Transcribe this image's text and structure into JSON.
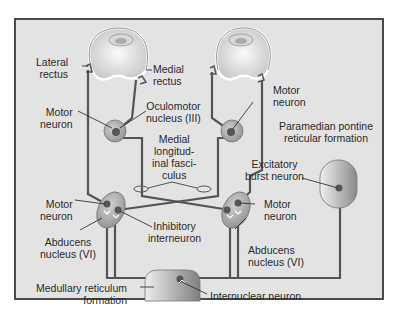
{
  "diagram": {
    "colors": {
      "background": "#e3e3e3",
      "frame_border": "#4a4a4a",
      "nerve_line": "#555555",
      "nucleus_fill": "#b8b8b8",
      "neuron_dot": "#555555",
      "text": "#2a2a2a"
    },
    "labels": {
      "lateral_rectus": [
        "Lateral",
        "rectus"
      ],
      "medial_rectus": [
        "Medial",
        "rectus"
      ],
      "motor_neuron_left_top": [
        "Motor",
        "neuron"
      ],
      "oculomotor_nucleus": [
        "Oculomotor",
        "nucleus (III)"
      ],
      "motor_neuron_right_top": [
        "Motor",
        "neuron"
      ],
      "pprf": [
        "Paramedian pontine",
        "reticular formation"
      ],
      "mlf": [
        "Medial",
        "longitud-",
        "inal fasci-",
        "culus"
      ],
      "excitatory_burst_neuron": [
        "Excitatory",
        "burst neuron"
      ],
      "motor_neuron_left_bottom": [
        "Motor",
        "neuron"
      ],
      "inhibitory_interneuron": [
        "Inhibitory",
        "interneuron"
      ],
      "motor_neuron_right_bottom": [
        "Motor",
        "neuron"
      ],
      "abducens_left": [
        "Abducens",
        "nucleus (VI)"
      ],
      "abducens_right": [
        "Abducens",
        "nucleus (VI)"
      ],
      "medullary_reticulum": [
        "Medullary reticulum",
        "formation"
      ],
      "internuclear_neuron": [
        "Internuclear neuron"
      ]
    }
  }
}
